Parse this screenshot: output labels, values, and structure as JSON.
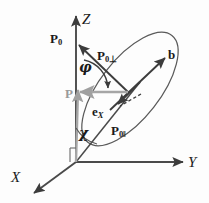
{
  "figure": {
    "background_color": "#fdfdfd",
    "stroke_color": "#3c3c3c",
    "gray_color": "#a0a0a0"
  },
  "axes": [
    {
      "name": "z-axis",
      "label": "Z",
      "direction": "up"
    },
    {
      "name": "y-axis",
      "label": "Y",
      "direction": "right"
    },
    {
      "name": "x-axis",
      "label": "X",
      "direction": "down-left"
    }
  ],
  "vectors": [
    {
      "name": "p0",
      "label": "P",
      "subscript": "0",
      "color": "#3c3c3c"
    },
    {
      "name": "p0-perp",
      "label": "P",
      "subscript": "0⊥",
      "color": "#3c3c3c"
    },
    {
      "name": "p0-par",
      "label": "P",
      "subscript": "0‖",
      "color": "#3c3c3c"
    },
    {
      "name": "b",
      "label": "b",
      "subscript": "",
      "color": "#3c3c3c"
    },
    {
      "name": "ex",
      "label": "e",
      "subscript": "X",
      "color": "#3c3c3c"
    },
    {
      "name": "p",
      "label": "P",
      "subscript": "",
      "color": "#a0a0a0"
    }
  ],
  "angles": [
    {
      "name": "phi",
      "label": "φ",
      "between": "P0 and P0-perp"
    },
    {
      "name": "chi",
      "label": "χ",
      "between": "Z axis and P0-parallel"
    }
  ],
  "labels": {
    "z": "Z",
    "y": "Y",
    "x": "X",
    "p0_base": "P",
    "p0_sub": "0",
    "p0perp_base": "P",
    "p0perp_sub": "0⊥",
    "p0par_base": "P",
    "p0par_sub": "0‖",
    "b": "b",
    "ex_base": "e",
    "ex_sub": "X",
    "p_gray": "P",
    "phi": "φ",
    "chi": "χ"
  },
  "shapes": {
    "ellipse": {
      "name": "polarization-ellipse",
      "rotation_deg": -52
    }
  }
}
